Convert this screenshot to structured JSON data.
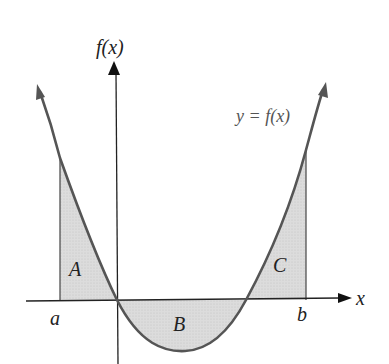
{
  "diagram": {
    "y_axis_label": "f(x)",
    "x_axis_label": "x",
    "curve_label": "y = f(x)",
    "endpoints": {
      "left": "a",
      "right": "b"
    },
    "regions": [
      {
        "label": "A",
        "sign": "positive"
      },
      {
        "label": "B",
        "sign": "negative"
      },
      {
        "label": "C",
        "sign": "positive"
      }
    ],
    "colors": {
      "curve": "#555555",
      "axis": "#222222",
      "fill": "#d9d9d9"
    }
  }
}
